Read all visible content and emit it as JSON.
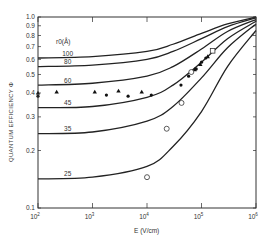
{
  "chart_data": {
    "type": "line",
    "title": "",
    "xlabel": "E (V/cm)",
    "ylabel": "QUANTUM EFFICIENCY Φ",
    "xscale": "log",
    "yscale": "log",
    "xlim": [
      100,
      1000000
    ],
    "ylim": [
      0.1,
      1.0
    ],
    "x_ticks": [
      "10^2",
      "10^3",
      "10^4",
      "10^5",
      "10^6"
    ],
    "y_ticks": [
      "0.1",
      "0.2",
      "0.3",
      "0.4",
      "0.5",
      "0.6",
      "0.7",
      "0.8",
      "0.9",
      "1.0"
    ],
    "legend_title": "r0(Å)",
    "grid": false,
    "x": [
      100,
      1000,
      10000,
      30000,
      100000,
      300000,
      1000000
    ],
    "series": [
      {
        "name": "100",
        "values": [
          0.61,
          0.62,
          0.66,
          0.72,
          0.82,
          0.92,
          1.0
        ]
      },
      {
        "name": "80",
        "values": [
          0.55,
          0.56,
          0.6,
          0.66,
          0.77,
          0.89,
          0.99
        ]
      },
      {
        "name": "60",
        "values": [
          0.44,
          0.45,
          0.49,
          0.55,
          0.68,
          0.84,
          0.97
        ]
      },
      {
        "name": "45",
        "values": [
          0.335,
          0.34,
          0.38,
          0.44,
          0.58,
          0.77,
          0.95
        ]
      },
      {
        "name": "35",
        "values": [
          0.245,
          0.25,
          0.285,
          0.34,
          0.48,
          0.69,
          0.92
        ]
      },
      {
        "name": "25",
        "values": [
          0.142,
          0.145,
          0.165,
          0.21,
          0.32,
          0.55,
          0.85
        ]
      }
    ],
    "markers": {
      "filled_triangles": [
        [
          100,
          0.4
        ],
        [
          220,
          0.405
        ],
        [
          1100,
          0.405
        ],
        [
          3000,
          0.41
        ],
        [
          8000,
          0.405
        ],
        [
          75000,
          0.53
        ],
        [
          95000,
          0.565
        ],
        [
          130000,
          0.62
        ]
      ],
      "filled_circles": [
        [
          100,
          0.385
        ],
        [
          1800,
          0.39
        ],
        [
          4500,
          0.385
        ],
        [
          12000,
          0.39
        ],
        [
          42000,
          0.44
        ],
        [
          58000,
          0.49
        ],
        [
          80000,
          0.535
        ],
        [
          100000,
          0.58
        ],
        [
          120000,
          0.61
        ]
      ],
      "open_circles": [
        [
          65000,
          0.515
        ],
        [
          43000,
          0.355
        ],
        [
          23000,
          0.26
        ],
        [
          10000,
          0.145
        ]
      ],
      "open_squares": [
        [
          160000,
          0.665
        ]
      ]
    }
  }
}
